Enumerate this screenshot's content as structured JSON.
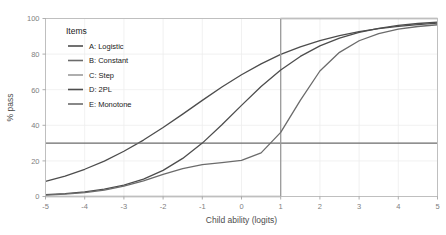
{
  "chart_data": {
    "type": "line",
    "title": "",
    "xlabel": "Child ability (logits)",
    "ylabel": "% pass",
    "xlim": [
      -5,
      5
    ],
    "ylim": [
      0,
      100
    ],
    "xticks": [
      "-5",
      "-4",
      "-3",
      "-2",
      "-1",
      "0",
      "1",
      "2",
      "3",
      "4",
      "5"
    ],
    "xtick_values": [
      -5,
      -4,
      -3,
      -2,
      -1,
      0,
      1,
      2,
      3,
      4,
      5
    ],
    "yticks": [
      "0",
      "20",
      "40",
      "60",
      "80",
      "100"
    ],
    "ytick_values": [
      0,
      20,
      40,
      60,
      80,
      100
    ],
    "grid": true,
    "legend_title": "Items",
    "legend_position": "top-left-inside",
    "x": [
      -5,
      -4.5,
      -4,
      -3.5,
      -3,
      -2.5,
      -2,
      -1.5,
      -1,
      -0.5,
      0,
      0.5,
      1,
      1.5,
      2,
      2.5,
      3,
      3.5,
      4,
      4.5,
      5
    ],
    "series": [
      {
        "name": "A: Logistic",
        "color": "#4d4d4d",
        "values": [
          8.5,
          11.5,
          15.3,
          19.9,
          25.4,
          31.7,
          38.8,
          46.3,
          54.0,
          61.5,
          68.4,
          74.5,
          79.8,
          84.1,
          87.6,
          90.4,
          92.6,
          94.3,
          95.6,
          96.6,
          97.4
        ]
      },
      {
        "name": "B: Constant",
        "color": "#6b6b6b",
        "values": [
          30,
          30,
          30,
          30,
          30,
          30,
          30,
          30,
          30,
          30,
          30,
          30,
          30,
          30,
          30,
          30,
          30,
          30,
          30,
          30,
          30
        ]
      },
      {
        "name": "C: Step",
        "color": "#9a9a9a",
        "values": [
          0,
          0,
          0,
          0,
          0,
          0,
          0,
          0,
          0,
          0,
          0,
          0,
          100,
          100,
          100,
          100,
          100,
          100,
          100,
          100,
          100
        ]
      },
      {
        "name": "D: 2PL",
        "color": "#4d4d4d",
        "values": [
          1.0,
          1.6,
          2.6,
          4.1,
          6.4,
          9.8,
          14.7,
          21.4,
          30.0,
          40.3,
          51.2,
          61.8,
          71.1,
          78.7,
          84.6,
          89.0,
          92.2,
          94.5,
          96.1,
          97.2,
          98.0
        ]
      },
      {
        "name": "E: Monotone",
        "color": "#6b6b6b",
        "values": [
          0.8,
          1.3,
          2.2,
          3.6,
          5.8,
          8.8,
          12.4,
          15.7,
          17.9,
          19.0,
          20.3,
          24.5,
          36.0,
          54.0,
          70.5,
          81.0,
          87.5,
          91.5,
          94.0,
          95.5,
          96.5
        ]
      }
    ]
  },
  "panel": {
    "background": "#ffffff",
    "border_color": "#bfbfbf",
    "gridline_color": "#ededed"
  }
}
